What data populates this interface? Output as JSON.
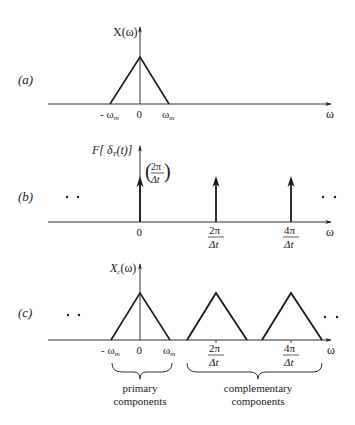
{
  "panels": [
    {
      "id": "a",
      "label": "(a)",
      "y_axis_label": "X(ω)",
      "x_axis_label": "ω",
      "ticks": [
        {
          "text": "- ω",
          "sub": "m",
          "x": 110
        },
        {
          "text": "0",
          "x": 140
        },
        {
          "text": "ω",
          "sub": "m",
          "x": 169
        }
      ]
    },
    {
      "id": "b",
      "label": "(b)",
      "y_axis_label_prefix": "F[ δ",
      "y_axis_label_sub": "T",
      "y_axis_label_suffix": "(t)]",
      "impulse_weight_num": "2π",
      "impulse_weight_den": "Δt",
      "x_axis_label": "ω",
      "ellipsis_left": "· ·",
      "ellipsis_right": "· ·",
      "ticks": [
        {
          "text": "0",
          "x": 140
        },
        {
          "num": "2π",
          "den": "Δt",
          "x": 216
        },
        {
          "num": "4π",
          "den": "Δt",
          "x": 291
        }
      ]
    },
    {
      "id": "c",
      "label": "(c)",
      "y_axis_label": "X",
      "y_axis_label_sub": "c",
      "y_axis_label_suffix": "(ω)",
      "x_axis_label": "ω",
      "ellipsis_left": "· ·",
      "ellipsis_right": "· ·",
      "ticks": [
        {
          "text": "- ω",
          "sub": "m",
          "x": 111
        },
        {
          "text": "0",
          "x": 140
        },
        {
          "text": "ω",
          "sub": "m",
          "x": 170
        },
        {
          "num": "2π",
          "den": "Δt",
          "x": 216
        },
        {
          "num": "4π",
          "den": "Δt",
          "x": 291
        }
      ],
      "braces": [
        {
          "line1": "primary",
          "line2": "components"
        },
        {
          "line1": "complementary",
          "line2": "components"
        }
      ]
    }
  ]
}
